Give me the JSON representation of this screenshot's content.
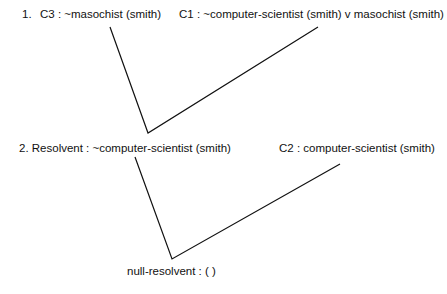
{
  "step1": {
    "number": "1.",
    "left_clause": "C3 : ~masochist (smith)",
    "right_clause": "C1 : ~computer-scientist (smith) v masochist (smith)"
  },
  "step2": {
    "left_clause": "2. Resolvent : ~computer-scientist (smith)",
    "right_clause": "C2 : computer-scientist (smith)"
  },
  "result": {
    "label": "null-resolvent : (  )"
  },
  "colors": {
    "line": "#111111",
    "text": "#111111",
    "background": "#ffffff"
  }
}
